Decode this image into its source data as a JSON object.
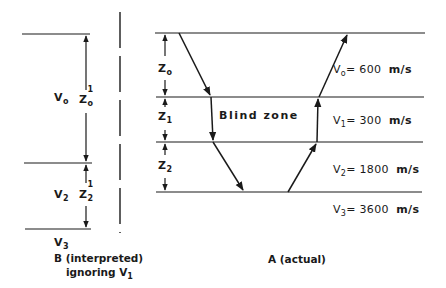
{
  "interpreted_model": {
    "caption_line1": "B (interpreted)",
    "caption_line2": "ignoring V",
    "caption_line2_sub": "1",
    "layers": [
      {
        "velocity_label": "V",
        "velocity_sub": "o",
        "thickness_label": "Z",
        "thickness_sub": "o",
        "thickness_sup": "1"
      },
      {
        "velocity_label": "V",
        "velocity_sub": "2",
        "thickness_label": "Z",
        "thickness_sub": "2",
        "thickness_sup": "1"
      }
    ],
    "halfspace_label": "V",
    "halfspace_sub": "3"
  },
  "actual_model": {
    "caption": "A (actual)",
    "blind_zone_label": "Blind zone",
    "layers": [
      {
        "thickness_label": "Z",
        "thickness_sub": "o",
        "velocity_label": "V",
        "velocity_sub": "o",
        "velocity_value": "= 600",
        "unit": "m/s"
      },
      {
        "thickness_label": "Z",
        "thickness_sub": "1",
        "velocity_label": "V",
        "velocity_sub": "1",
        "velocity_value": "= 300",
        "unit": "m/s"
      },
      {
        "thickness_label": "Z",
        "thickness_sub": "2",
        "velocity_label": "V",
        "velocity_sub": "2",
        "velocity_value": "= 1800",
        "unit": "m/s"
      },
      {
        "velocity_label": "V",
        "velocity_sub": "3",
        "velocity_value": "= 3600",
        "unit": "m/s"
      }
    ]
  },
  "colors": {
    "ink": "#1a1a1a",
    "background": "#ffffff"
  }
}
